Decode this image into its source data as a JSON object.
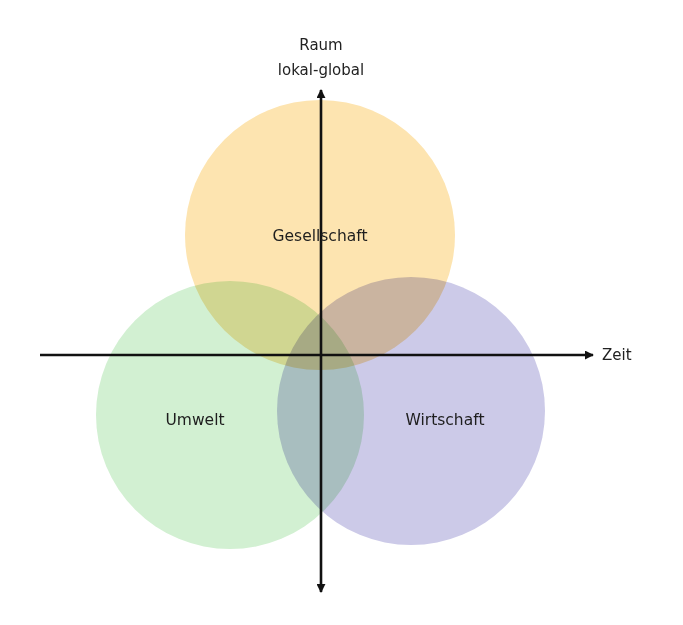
{
  "diagram": {
    "type": "venn-with-axes",
    "circles": [
      {
        "name": "umwelt",
        "label": "Umwelt",
        "cx": 230,
        "cy": 415,
        "r": 134,
        "color": "#d2f0d2"
      },
      {
        "name": "wirtschaft",
        "label": "Wirtschaft",
        "cx": 411,
        "cy": 411,
        "r": 134,
        "color": "#cccae8"
      },
      {
        "name": "gesellschaft",
        "label": "Gesellschaft",
        "cx": 320,
        "cy": 235,
        "r": 135,
        "color": "#fde4b0"
      }
    ],
    "axes": {
      "vertical": {
        "label_line1": "Raum",
        "label_line2": "lokal-global",
        "x": 321,
        "y_top": 88,
        "y_bottom": 592,
        "arrows": "both"
      },
      "horizontal": {
        "label": "Zeit",
        "y": 355,
        "x_left": 40,
        "x_right": 595,
        "arrows": "right"
      },
      "color": "#111111"
    }
  }
}
